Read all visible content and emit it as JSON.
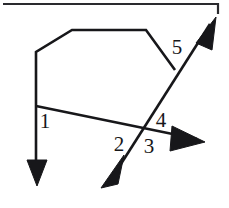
{
  "figure": {
    "background_color": "#ffffff",
    "line_color": "#17171a",
    "width": 229,
    "height": 208,
    "labels": [
      {
        "text": "1",
        "x": 45,
        "y": 123
      },
      {
        "text": "2",
        "x": 119,
        "y": 146
      },
      {
        "text": "3",
        "x": 149,
        "y": 148
      },
      {
        "text": "4",
        "x": 161,
        "y": 122
      },
      {
        "text": "5",
        "x": 177,
        "y": 49
      }
    ],
    "strokes": {
      "top_border": "M 3 4 L 218 4 L 218 14",
      "polygon_chain": "M 36 106 L 36 52 L 72 30 L 146 30 L 175 70",
      "transversal_down_right": "M 36 106 L 197 139",
      "vertical_down": "M 36 106 L 36 176",
      "diagonal_sw_ne": "M 112 178 L 210 24"
    },
    "arrow_heads": [
      {
        "name": "arrow-down",
        "points": "27,160 47,160 37,186"
      },
      {
        "name": "arrow-right",
        "points": "172,126 205,142 170,151"
      },
      {
        "name": "arrow-southwest",
        "points": "124,155 118,184 101,188"
      },
      {
        "name": "arrow-northeast",
        "points": "196,43 216,17 212,50"
      }
    ]
  }
}
